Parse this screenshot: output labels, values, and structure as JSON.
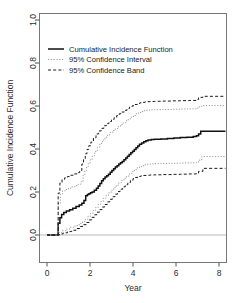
{
  "chart_data": {
    "type": "line",
    "title": "",
    "subtitle": "",
    "xlabel": "Year",
    "ylabel": "Cumulative Incidence Function",
    "xlim": [
      -0.35,
      8.35
    ],
    "ylim": [
      -0.07,
      1.04
    ],
    "xticks": [
      0,
      2,
      4,
      6,
      8
    ],
    "xticklabels": [
      "0",
      "2",
      "4",
      "6",
      "8"
    ],
    "yticks": [
      0.0,
      0.2,
      0.4,
      0.6,
      0.8,
      1.0
    ],
    "yticklabels": [
      "0.0",
      "0.2",
      "0.4",
      "0.6",
      "0.8",
      "1.0"
    ],
    "grid": false,
    "reference_line_y": 0.0,
    "legend_position": "top-left",
    "legend": [
      {
        "label": "Cumulative Incidence Function",
        "style": "solid",
        "color": "#111111"
      },
      {
        "label": "95% Confidence Interval",
        "style": "dotted",
        "color": "#9a9a9a"
      },
      {
        "label": "95% Confidence Band",
        "style": "dashed",
        "color": "#1a1a1a"
      }
    ],
    "series": [
      {
        "name": "Cumulative Incidence Function",
        "style": "solid",
        "color": "#111111",
        "step": true,
        "x": [
          0.0,
          0.5,
          0.52,
          0.6,
          0.68,
          0.78,
          0.9,
          1.05,
          1.2,
          1.35,
          1.5,
          1.62,
          1.72,
          1.8,
          1.88,
          1.95,
          2.02,
          2.1,
          2.2,
          2.3,
          2.38,
          2.46,
          2.54,
          2.62,
          2.7,
          2.78,
          2.86,
          2.94,
          3.02,
          3.1,
          3.18,
          3.26,
          3.34,
          3.42,
          3.5,
          3.58,
          3.66,
          3.74,
          3.82,
          3.9,
          3.98,
          4.06,
          4.14,
          4.22,
          4.3,
          4.4,
          4.5,
          4.6,
          4.7,
          4.85,
          5.0,
          5.3,
          5.6,
          5.9,
          6.2,
          6.5,
          6.8,
          6.95,
          7.05,
          7.15,
          8.3
        ],
        "y": [
          0.0,
          0.0,
          0.055,
          0.08,
          0.095,
          0.105,
          0.112,
          0.118,
          0.125,
          0.132,
          0.14,
          0.148,
          0.16,
          0.182,
          0.188,
          0.192,
          0.196,
          0.2,
          0.208,
          0.218,
          0.228,
          0.24,
          0.252,
          0.262,
          0.27,
          0.276,
          0.282,
          0.292,
          0.3,
          0.308,
          0.316,
          0.322,
          0.33,
          0.336,
          0.342,
          0.35,
          0.358,
          0.366,
          0.374,
          0.382,
          0.39,
          0.398,
          0.406,
          0.414,
          0.422,
          0.428,
          0.434,
          0.438,
          0.442,
          0.444,
          0.445,
          0.447,
          0.449,
          0.451,
          0.453,
          0.455,
          0.458,
          0.462,
          0.47,
          0.482,
          0.482
        ]
      },
      {
        "name": "95% Confidence Interval upper",
        "style": "dotted",
        "color": "#9a9a9a",
        "step": true,
        "x": [
          0.0,
          0.5,
          0.52,
          0.62,
          0.72,
          0.85,
          1.0,
          1.15,
          1.3,
          1.45,
          1.58,
          1.68,
          1.76,
          1.84,
          1.92,
          2.0,
          2.1,
          2.22,
          2.34,
          2.46,
          2.58,
          2.7,
          2.82,
          2.94,
          3.06,
          3.18,
          3.3,
          3.42,
          3.54,
          3.66,
          3.78,
          3.9,
          4.02,
          4.14,
          4.26,
          4.38,
          4.5,
          4.62,
          4.74,
          4.86,
          5.0,
          5.4,
          5.8,
          6.2,
          6.6,
          6.95,
          7.05,
          7.2,
          8.3
        ],
        "y": [
          0.0,
          0.0,
          0.148,
          0.19,
          0.205,
          0.212,
          0.218,
          0.224,
          0.23,
          0.236,
          0.248,
          0.28,
          0.3,
          0.318,
          0.334,
          0.35,
          0.368,
          0.388,
          0.408,
          0.426,
          0.442,
          0.455,
          0.466,
          0.476,
          0.486,
          0.495,
          0.504,
          0.513,
          0.522,
          0.531,
          0.54,
          0.548,
          0.556,
          0.564,
          0.57,
          0.574,
          0.578,
          0.58,
          0.581,
          0.582,
          0.583,
          0.584,
          0.585,
          0.586,
          0.587,
          0.59,
          0.596,
          0.602,
          0.602
        ]
      },
      {
        "name": "95% Confidence Interval lower",
        "style": "dotted",
        "color": "#9a9a9a",
        "step": true,
        "x": [
          0.0,
          0.5,
          0.55,
          0.7,
          0.9,
          1.1,
          1.3,
          1.5,
          1.65,
          1.78,
          1.9,
          2.02,
          2.14,
          2.26,
          2.38,
          2.5,
          2.62,
          2.74,
          2.86,
          2.98,
          3.1,
          3.22,
          3.34,
          3.46,
          3.58,
          3.7,
          3.82,
          3.94,
          4.06,
          4.18,
          4.3,
          4.42,
          4.54,
          4.66,
          4.8,
          5.0,
          5.4,
          5.8,
          6.2,
          6.6,
          6.95,
          7.05,
          7.2,
          8.3
        ],
        "y": [
          0.0,
          0.0,
          0.012,
          0.02,
          0.028,
          0.036,
          0.044,
          0.054,
          0.062,
          0.072,
          0.086,
          0.1,
          0.114,
          0.128,
          0.142,
          0.156,
          0.17,
          0.184,
          0.196,
          0.208,
          0.22,
          0.232,
          0.243,
          0.254,
          0.264,
          0.274,
          0.284,
          0.294,
          0.304,
          0.312,
          0.318,
          0.322,
          0.326,
          0.329,
          0.331,
          0.332,
          0.333,
          0.334,
          0.335,
          0.336,
          0.338,
          0.348,
          0.365,
          0.365
        ]
      },
      {
        "name": "95% Confidence Band upper",
        "style": "dashed",
        "color": "#1a1a1a",
        "step": true,
        "x": [
          0.0,
          0.5,
          0.52,
          0.6,
          0.7,
          0.82,
          0.95,
          1.1,
          1.25,
          1.4,
          1.52,
          1.62,
          1.7,
          1.78,
          1.86,
          1.94,
          2.04,
          2.16,
          2.28,
          2.4,
          2.52,
          2.64,
          2.76,
          2.88,
          3.0,
          3.12,
          3.24,
          3.36,
          3.48,
          3.6,
          3.72,
          3.84,
          3.96,
          4.08,
          4.2,
          4.32,
          4.44,
          4.56,
          4.68,
          4.8,
          5.0,
          5.4,
          5.8,
          6.2,
          6.6,
          6.95,
          7.05,
          7.25,
          8.3
        ],
        "y": [
          0.0,
          0.0,
          0.195,
          0.242,
          0.258,
          0.266,
          0.272,
          0.278,
          0.284,
          0.29,
          0.3,
          0.33,
          0.355,
          0.378,
          0.398,
          0.415,
          0.432,
          0.452,
          0.47,
          0.484,
          0.496,
          0.508,
          0.518,
          0.528,
          0.537,
          0.546,
          0.555,
          0.564,
          0.572,
          0.58,
          0.588,
          0.595,
          0.601,
          0.607,
          0.612,
          0.615,
          0.617,
          0.619,
          0.62,
          0.621,
          0.622,
          0.623,
          0.624,
          0.625,
          0.626,
          0.63,
          0.64,
          0.645,
          0.645
        ]
      },
      {
        "name": "95% Confidence Band lower",
        "style": "dashed",
        "color": "#1a1a1a",
        "step": true,
        "x": [
          0.0,
          0.5,
          0.58,
          0.75,
          0.95,
          1.15,
          1.35,
          1.55,
          1.7,
          1.84,
          1.96,
          2.08,
          2.2,
          2.32,
          2.44,
          2.56,
          2.68,
          2.8,
          2.92,
          3.04,
          3.16,
          3.28,
          3.4,
          3.52,
          3.64,
          3.76,
          3.88,
          4.0,
          4.12,
          4.24,
          4.36,
          4.48,
          4.62,
          4.78,
          5.0,
          5.4,
          5.8,
          6.2,
          6.6,
          6.95,
          7.05,
          7.25,
          8.3
        ],
        "y": [
          0.0,
          0.0,
          0.005,
          0.01,
          0.016,
          0.022,
          0.03,
          0.04,
          0.048,
          0.058,
          0.07,
          0.082,
          0.094,
          0.106,
          0.118,
          0.13,
          0.142,
          0.154,
          0.166,
          0.178,
          0.19,
          0.202,
          0.213,
          0.224,
          0.234,
          0.244,
          0.254,
          0.262,
          0.268,
          0.272,
          0.275,
          0.277,
          0.278,
          0.279,
          0.28,
          0.281,
          0.282,
          0.283,
          0.284,
          0.286,
          0.296,
          0.31,
          0.31
        ]
      }
    ]
  }
}
